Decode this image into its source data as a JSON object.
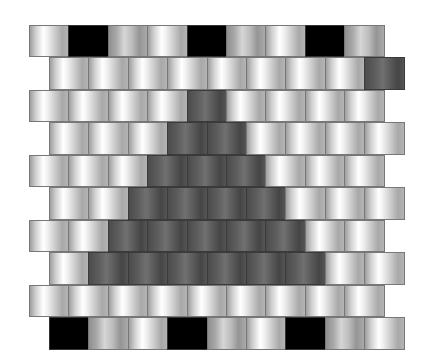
{
  "legend": {
    "light": "light gray brick",
    "mid": "medium gray brick",
    "dark": "dark gray brick",
    "black": "black brick"
  },
  "colors": {
    "light_highlight": "#ffffff",
    "mid_base": "#a9a9a9",
    "dark_base": "#5d5d5d",
    "black": "#000000",
    "mortar": "#777777"
  },
  "rows": [
    {
      "offset": "left",
      "bricks": [
        "light",
        "black",
        "mid",
        "light",
        "black",
        "mid",
        "light",
        "black",
        "mid"
      ]
    },
    {
      "offset": "right",
      "bricks": [
        "light",
        "light",
        "light",
        "light",
        "light",
        "light",
        "light",
        "light",
        "dark"
      ]
    },
    {
      "offset": "left",
      "bricks": [
        "light",
        "light",
        "light",
        "light",
        "dark",
        "light",
        "light",
        "light",
        "light"
      ]
    },
    {
      "offset": "right",
      "bricks": [
        "light",
        "light",
        "light",
        "dark",
        "dark",
        "light",
        "light",
        "light",
        "light"
      ]
    },
    {
      "offset": "left",
      "bricks": [
        "light",
        "light",
        "light",
        "dark",
        "dark",
        "dark",
        "light",
        "light",
        "light"
      ]
    },
    {
      "offset": "right",
      "bricks": [
        "light",
        "light",
        "dark",
        "dark",
        "dark",
        "dark",
        "light",
        "light",
        "light"
      ]
    },
    {
      "offset": "left",
      "bricks": [
        "light",
        "light",
        "dark",
        "dark",
        "dark",
        "dark",
        "dark",
        "light",
        "light"
      ]
    },
    {
      "offset": "right",
      "bricks": [
        "light",
        "dark",
        "dark",
        "dark",
        "dark",
        "dark",
        "dark",
        "light",
        "light"
      ]
    },
    {
      "offset": "left",
      "bricks": [
        "light",
        "light",
        "light",
        "light",
        "light",
        "light",
        "light",
        "light",
        "light"
      ]
    },
    {
      "offset": "right",
      "bricks": [
        "black",
        "mid",
        "light",
        "black",
        "mid",
        "light",
        "black",
        "mid",
        "light"
      ]
    }
  ]
}
